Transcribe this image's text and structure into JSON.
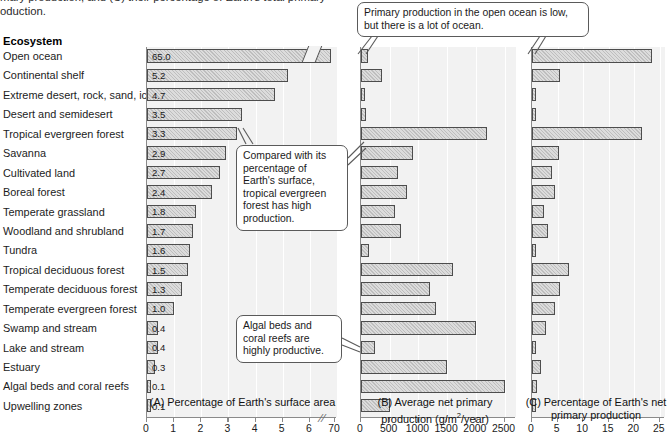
{
  "caption": {
    "line1": "mary production, and (C) their percentage of Earth's total primary",
    "line2": "oduction."
  },
  "column_header": "Ecosystem",
  "callouts": [
    {
      "name": "open-ocean-callout",
      "text": "Primary production in the open ocean is low, but there is a lot of ocean."
    },
    {
      "name": "tropical-forest-callout",
      "text": "Compared with its percentage of Earth's surface, tropical evergreen forest has high production."
    },
    {
      "name": "algal-beds-callout",
      "text": "Algal beds and coral reefs are highly productive."
    }
  ],
  "chart_data": [
    {
      "type": "bar",
      "panel": "A",
      "title": "(A) Percentage of Earth's surface area",
      "xlabel": "Percentage of Earth's surface area",
      "ylabel": "Ecosystem",
      "orientation": "horizontal",
      "grid": true,
      "axis_break": true,
      "xlim": [
        0,
        7
      ],
      "xticks": [
        0,
        1,
        2,
        3,
        4,
        5,
        6,
        70
      ],
      "xtick_labels": [
        "0",
        "1",
        "2",
        "3",
        "4",
        "5",
        "6",
        "70"
      ],
      "show_value_labels": true,
      "categories": [
        "Open ocean",
        "Continental shelf",
        "Extreme desert, rock, sand, ice",
        "Desert and semidesert",
        "Tropical evergreen forest",
        "Savanna",
        "Cultivated land",
        "Boreal forest",
        "Temperate grassland",
        "Woodland and shrubland",
        "Tundra",
        "Tropical deciduous forest",
        "Temperate deciduous forest",
        "Temperate evergreen forest",
        "Swamp and stream",
        "Lake and stream",
        "Estuary",
        "Algal beds and coral reefs",
        "Upwelling zones"
      ],
      "values": [
        65.0,
        5.2,
        4.7,
        3.5,
        3.3,
        2.9,
        2.7,
        2.4,
        1.8,
        1.7,
        1.6,
        1.5,
        1.3,
        1.0,
        0.4,
        0.4,
        0.3,
        0.1,
        0.1
      ],
      "value_labels": [
        "65.0",
        "5.2",
        "4.7",
        "3.5",
        "3.3",
        "2.9",
        "2.7",
        "2.4",
        "1.8",
        "1.7",
        "1.6",
        "1.5",
        "1.3",
        "1.0",
        "0.4",
        "0.4",
        "0.3",
        "0.1",
        "0.1"
      ]
    },
    {
      "type": "bar",
      "panel": "B",
      "title": "(B) Average net primary production (g/m2/year)",
      "xlabel": "Average net primary production (g/m2/year)",
      "ylabel": "Ecosystem",
      "orientation": "horizontal",
      "grid": true,
      "xlim": [
        0,
        2700
      ],
      "xticks": [
        0,
        500,
        1000,
        1500,
        2000,
        2500
      ],
      "xtick_labels": [
        "0",
        "500",
        "1000",
        "1500",
        "2000",
        "2500"
      ],
      "show_value_labels": false,
      "categories": [
        "Open ocean",
        "Continental shelf",
        "Extreme desert, rock, sand, ice",
        "Desert and semidesert",
        "Tropical evergreen forest",
        "Savanna",
        "Cultivated land",
        "Boreal forest",
        "Temperate grassland",
        "Woodland and shrubland",
        "Tundra",
        "Tropical deciduous forest",
        "Temperate deciduous forest",
        "Temperate evergreen forest",
        "Swamp and stream",
        "Lake and stream",
        "Estuary",
        "Algal beds and coral reefs",
        "Upwelling zones"
      ],
      "values": [
        125,
        360,
        3,
        90,
        2200,
        900,
        650,
        800,
        600,
        700,
        140,
        1600,
        1200,
        1300,
        2000,
        250,
        1500,
        2500,
        500
      ]
    },
    {
      "type": "bar",
      "panel": "C",
      "title": "(C) Percentage of Earth's net primary production",
      "xlabel": "Percentage of Earth's net primary production",
      "ylabel": "Ecosystem",
      "orientation": "horizontal",
      "grid": true,
      "xlim": [
        0,
        26
      ],
      "xticks": [
        0,
        5,
        10,
        15,
        20,
        25
      ],
      "xtick_labels": [
        "0",
        "5",
        "10",
        "15",
        "20",
        "25"
      ],
      "show_value_labels": false,
      "categories": [
        "Open ocean",
        "Continental shelf",
        "Extreme desert, rock, sand, ice",
        "Desert and semidesert",
        "Tropical evergreen forest",
        "Savanna",
        "Cultivated land",
        "Boreal forest",
        "Temperate grassland",
        "Woodland and shrubland",
        "Tundra",
        "Tropical deciduous forest",
        "Temperate deciduous forest",
        "Temperate evergreen forest",
        "Swamp and stream",
        "Lake and stream",
        "Estuary",
        "Algal beds and coral reefs",
        "Upwelling zones"
      ],
      "values": [
        23.5,
        5.4,
        0.1,
        0.6,
        21.5,
        5.2,
        4.0,
        4.5,
        2.3,
        3.1,
        0.6,
        7.3,
        5.4,
        4.5,
        2.8,
        0.5,
        1.7,
        1.0,
        0.3
      ]
    }
  ]
}
